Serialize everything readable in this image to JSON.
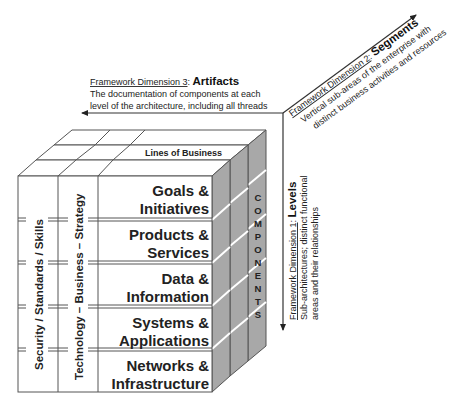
{
  "diagram": {
    "dimensions": {
      "artifacts": {
        "label": "Framework Dimension 3",
        "sep": ": ",
        "title": "Artifacts",
        "line1": "The documentation of components at each",
        "line2": "level of the architecture, including all threads"
      },
      "segments": {
        "label": "Framework Dimension 2",
        "sep": ": ",
        "title": "Segments",
        "line1": "Vertical sub-areas of the enterprise with",
        "line2": "distinct business activities and resources"
      },
      "levels": {
        "label": "Framework Dimension 1",
        "sep": ": ",
        "title": "Levels",
        "line1": "Sub-architectures; distinct functional",
        "line2": "areas and their relationships"
      }
    },
    "cube": {
      "top_label": "Lines of Business",
      "side_label": "COMPONENTS",
      "side_letters": [
        "C",
        "O",
        "M",
        "P",
        "O",
        "N",
        "E",
        "N",
        "T",
        "S"
      ],
      "threads": [
        "Security / Standards / Skills",
        "Technology – Business – Strategy"
      ],
      "levels": [
        {
          "line1": "Goals &",
          "line2": "Initiatives"
        },
        {
          "line1": "Products &",
          "line2": "Services"
        },
        {
          "line1": "Data &",
          "line2": "Information"
        },
        {
          "line1": "Systems &",
          "line2": "Applications"
        },
        {
          "line1": "Networks &",
          "line2": "Infrastructure"
        }
      ]
    },
    "colors": {
      "face": "#ffffff",
      "side": "#a8a8a8",
      "line": "#555555",
      "text": "#222222"
    }
  }
}
